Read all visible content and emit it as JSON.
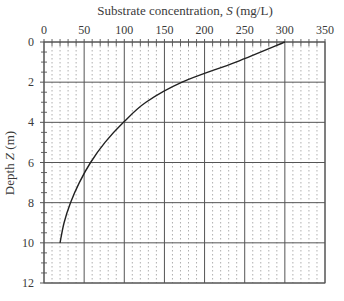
{
  "chart_data": {
    "type": "line",
    "title": "",
    "xlabel": "Substrate concentration, S (mg/L)",
    "xlabel_parts": {
      "prefix": "Substrate concentration, ",
      "italic": "S",
      "suffix": " (mg/L)"
    },
    "ylabel": "Depth Z (m)",
    "ylabel_parts": {
      "prefix": "Depth ",
      "italic": "Z",
      "suffix": " (m)"
    },
    "x_axis_position": "top",
    "y_axis_inverted": true,
    "xlim": [
      0,
      350
    ],
    "ylim": [
      0,
      12
    ],
    "x_ticks": [
      0,
      50,
      100,
      150,
      200,
      250,
      300,
      350
    ],
    "y_ticks": [
      0,
      2,
      4,
      6,
      8,
      10,
      12
    ],
    "x_minor_step": 10,
    "y_minor_step": 0.5,
    "grid": {
      "major": true,
      "minor_x_dotted": true
    },
    "legend": null,
    "series": [
      {
        "name": "S vs depth",
        "x": [
          300,
          239,
          172,
          127,
          99,
          76,
          58,
          44,
          33,
          25,
          20
        ],
        "y": [
          0,
          1,
          2,
          3,
          4,
          5,
          6,
          7,
          8,
          9,
          10
        ]
      }
    ]
  },
  "colors": {
    "grid_major": "#555555",
    "grid_minor": "#9a9a9a",
    "curve": "#222222",
    "text": "#3a3a3a"
  }
}
